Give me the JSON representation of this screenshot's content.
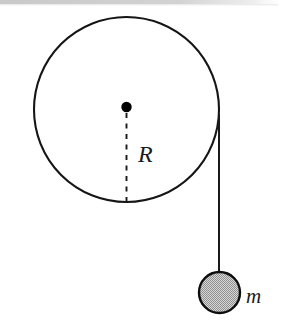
{
  "figure": {
    "kind": "physics-free-body-diagram",
    "width": 289,
    "height": 334,
    "background_color": "#ffffff"
  },
  "top_band": {
    "name": "page-edge-band",
    "color": "#cfcfcf",
    "height_px": 4
  },
  "pulley": {
    "label": "wheel",
    "center_x": 126.5,
    "center_y": 109.5,
    "radius": 92.5,
    "stroke_color": "#151515",
    "stroke_width": 2.1,
    "fill": "none"
  },
  "axle": {
    "label": "center-point",
    "center_x": 126.5,
    "center_y": 107.0,
    "radius": 5.2,
    "color": "#000000"
  },
  "radius_line": {
    "label": "R",
    "from_x": 126.5,
    "from_y": 113.0,
    "to_x": 126.5,
    "to_y": 202.0,
    "dash_on": 5,
    "dash_off": 5.5,
    "color": "#1a1a1a",
    "stroke_width": 1.9
  },
  "radius_label": {
    "text": "R",
    "x": 138,
    "y": 162
  },
  "rope": {
    "label": "string",
    "x": 219.0,
    "from_y": 114.0,
    "to_y": 292.5,
    "color": "#1a1a1a",
    "stroke_width": 2.0
  },
  "mass": {
    "label": "hanging mass",
    "center_x": 219.5,
    "center_y": 292.5,
    "radius": 20.5,
    "fill_color": "#b4b4b4",
    "stroke_color": "#0d0d0d",
    "stroke_width": 2.4
  },
  "mass_label": {
    "text": "m",
    "x": 246,
    "y": 303
  }
}
